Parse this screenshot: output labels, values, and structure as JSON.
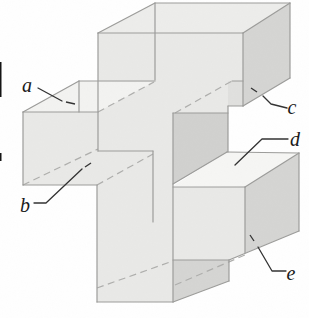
{
  "figure": {
    "type": "3d-solid-diagram",
    "labels": [
      {
        "id": "a",
        "text": "a",
        "x": 27,
        "y": 92
      },
      {
        "id": "b",
        "text": "b",
        "x": 25,
        "y": 212
      },
      {
        "id": "c",
        "text": "c",
        "x": 292,
        "y": 114
      },
      {
        "id": "d",
        "text": "d",
        "x": 295,
        "y": 146
      },
      {
        "id": "e",
        "text": "e",
        "x": 291,
        "y": 280
      }
    ],
    "label_font_size": 20,
    "colors": {
      "page": "#ffffff",
      "front": "#e9e9e7",
      "top": "#ededeb",
      "top_light": "#f3f3f1",
      "bright": "#f6f6f4",
      "dark": "#d5d5d3",
      "dark2": "#d1d1cf",
      "window": "#e0e0de",
      "edge": "#9c9c9a",
      "hidden_edge": "#aeaeac",
      "leader": "#333333",
      "label_ink": "#1a1a1a",
      "artifact": "#151515"
    },
    "faces": [
      {
        "name": "top-arm-top-face",
        "fill": "top",
        "points": [
          [
            98,
            33
          ],
          [
            155,
            3
          ],
          [
            290,
            3
          ],
          [
            243,
            33
          ]
        ]
      },
      {
        "name": "top-arm-front-face",
        "fill": "front",
        "points": [
          [
            98,
            33
          ],
          [
            243,
            33
          ],
          [
            243,
            106
          ],
          [
            228,
            106
          ],
          [
            228,
            113
          ],
          [
            98,
            113
          ]
        ]
      },
      {
        "name": "see-through-window",
        "fill": "window",
        "points": [
          [
            228,
            81
          ],
          [
            243,
            81
          ],
          [
            243,
            106
          ],
          [
            228,
            106
          ]
        ]
      },
      {
        "name": "left-arm-top-face-a",
        "fill": "top_light",
        "points": [
          [
            23,
            112
          ],
          [
            79,
            81
          ],
          [
            154,
            82
          ],
          [
            98,
            112
          ]
        ]
      },
      {
        "name": "top-arm-right-face-c",
        "fill": "dark",
        "points": [
          [
            243,
            33
          ],
          [
            290,
            3
          ],
          [
            290,
            78
          ],
          [
            243,
            106
          ]
        ]
      },
      {
        "name": "left-arm-front-face",
        "fill": "front",
        "points": [
          [
            23,
            112
          ],
          [
            97,
            112
          ],
          [
            97,
            185
          ],
          [
            23,
            185
          ]
        ]
      },
      {
        "name": "center-and-bottom-front",
        "fill": "front",
        "points": [
          [
            97,
            112
          ],
          [
            173,
            112
          ],
          [
            173,
            302
          ],
          [
            97,
            302
          ]
        ]
      },
      {
        "name": "notch-back-wall",
        "fill": "dark2",
        "points": [
          [
            173,
            113
          ],
          [
            228,
            113
          ],
          [
            228,
            152
          ],
          [
            173,
            184
          ]
        ]
      },
      {
        "name": "right-arm-top-face-d",
        "fill": "bright",
        "points": [
          [
            173,
            186
          ],
          [
            227,
            152
          ],
          [
            299,
            153
          ],
          [
            245,
            187
          ]
        ]
      },
      {
        "name": "right-arm-right-face-e",
        "fill": "dark",
        "points": [
          [
            245,
            187
          ],
          [
            299,
            153
          ],
          [
            299,
            231
          ],
          [
            245,
            253
          ]
        ]
      },
      {
        "name": "right-arm-front-face",
        "fill": "front",
        "points": [
          [
            173,
            187
          ],
          [
            245,
            187
          ],
          [
            245,
            253
          ],
          [
            229,
            260
          ],
          [
            173,
            260
          ]
        ]
      },
      {
        "name": "bottom-arm-right-face",
        "fill": "dark",
        "points": [
          [
            173,
            260
          ],
          [
            229,
            260
          ],
          [
            229,
            281
          ],
          [
            173,
            302
          ]
        ]
      }
    ],
    "edges_solid": [
      [
        155,
        3,
        290,
        3
      ],
      [
        98,
        33,
        243,
        33
      ],
      [
        98,
        33,
        155,
        3
      ],
      [
        243,
        33,
        290,
        3
      ],
      [
        98,
        33,
        98,
        151
      ],
      [
        243,
        33,
        243,
        106
      ],
      [
        155,
        3,
        155,
        80
      ],
      [
        79,
        81,
        155,
        81
      ],
      [
        23,
        112,
        79,
        81
      ],
      [
        79,
        81,
        79,
        112
      ],
      [
        23,
        112,
        98,
        112
      ],
      [
        23,
        112,
        23,
        185
      ],
      [
        23,
        185,
        97,
        185
      ],
      [
        97,
        185,
        97,
        302
      ],
      [
        97,
        302,
        173,
        302
      ],
      [
        173,
        113,
        173,
        302
      ],
      [
        98,
        151,
        153,
        151
      ],
      [
        153,
        151,
        153,
        222
      ],
      [
        173,
        113,
        228,
        113
      ],
      [
        228,
        106,
        228,
        152
      ],
      [
        228,
        106,
        243,
        106
      ],
      [
        232,
        81,
        243,
        81
      ],
      [
        243,
        106,
        290,
        78
      ],
      [
        290,
        3,
        290,
        78
      ],
      [
        173,
        184,
        227,
        152
      ],
      [
        227,
        152,
        299,
        153
      ],
      [
        173,
        187,
        245,
        187
      ],
      [
        245,
        187,
        245,
        253
      ],
      [
        299,
        153,
        299,
        231
      ],
      [
        245,
        187,
        299,
        153
      ],
      [
        229,
        260,
        299,
        231
      ],
      [
        173,
        260,
        229,
        260
      ],
      [
        229,
        260,
        229,
        281
      ],
      [
        173,
        302,
        229,
        281
      ]
    ],
    "edges_dashed": [
      [
        175,
        113,
        232,
        81
      ],
      [
        98,
        112,
        154,
        82
      ],
      [
        23,
        185,
        98,
        149
      ],
      [
        97,
        185,
        153,
        154
      ],
      [
        175,
        285,
        245,
        255
      ],
      [
        97,
        288,
        173,
        261
      ]
    ],
    "leaders": [
      {
        "for": "a",
        "points": [
          [
            38,
            88
          ],
          [
            62,
            101
          ]
        ],
        "tip": [
          66,
          102,
          75,
          104
        ]
      },
      {
        "for": "b",
        "points": [
          [
            34,
            203
          ],
          [
            46,
            203
          ],
          [
            82,
            169
          ]
        ],
        "tip": [
          85,
          167,
          91,
          163
        ]
      },
      {
        "for": "c",
        "points": [
          [
            287,
            108
          ],
          [
            271,
            104
          ],
          [
            263,
            96
          ]
        ],
        "tip": [
          257,
          92,
          251,
          88
        ]
      },
      {
        "for": "d",
        "points": [
          [
            288,
            139
          ],
          [
            262,
            139
          ],
          [
            235,
            165
          ]
        ],
        "tip": null
      },
      {
        "for": "e",
        "points": [
          [
            286,
            271
          ],
          [
            272,
            271
          ],
          [
            258,
            247
          ]
        ],
        "tip": [
          254,
          241,
          250,
          235
        ]
      }
    ],
    "scan_artifacts": [
      {
        "x": 0,
        "y": 62,
        "w": 1.5,
        "h": 35
      },
      {
        "x": 0,
        "y": 153,
        "w": 1.5,
        "h": 8
      }
    ]
  }
}
